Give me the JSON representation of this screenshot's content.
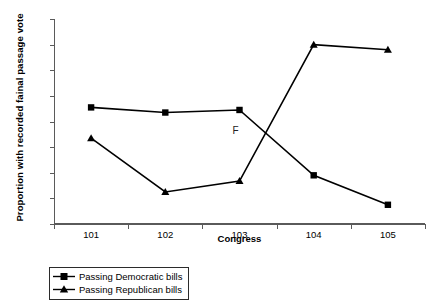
{
  "chart_data": {
    "type": "line",
    "title": "",
    "xlabel": "Congress",
    "ylabel": "Proportion with recorded fainal passage vote",
    "categories": [
      "101",
      "102",
      "103",
      "104",
      "105"
    ],
    "x": [
      101,
      102,
      103,
      104,
      105
    ],
    "ylim": [
      0,
      0.16
    ],
    "ytick_labels": [
      "0",
      "0.02",
      "0.04",
      "0.06",
      "0.08",
      "0.1",
      "0.12",
      "0.14",
      "0.16"
    ],
    "ytick_values": [
      0,
      0.02,
      0.04,
      0.06,
      0.08,
      0.1,
      0.12,
      0.14,
      0.16
    ],
    "grid": false,
    "legend_position": "bottom-left",
    "series": [
      {
        "name": "Passing Democratic bills",
        "marker": "square",
        "color": "#000000",
        "values": [
          0.091,
          0.087,
          0.089,
          0.038,
          0.015
        ]
      },
      {
        "name": "Passing Republican bills",
        "marker": "triangle",
        "color": "#000000",
        "values": [
          0.067,
          0.025,
          0.0335,
          0.14,
          0.136
        ]
      }
    ],
    "annotations": [
      {
        "text": "F",
        "x": 103,
        "y": 0.0715
      }
    ]
  },
  "axis": {
    "y_title": "Proportion with recorded fainal passage vote",
    "x_title": "Congress",
    "y_labels": [
      "0.16",
      "0.14",
      "0.12",
      "0.1",
      "0.08",
      "0.06",
      "0.04",
      "0.02",
      "0"
    ],
    "x_labels": [
      "101",
      "102",
      "103",
      "104",
      "105"
    ]
  },
  "legend": {
    "items": [
      {
        "label": "Passing Democratic bills",
        "marker": "square-marker"
      },
      {
        "label": "Passing Republican bills",
        "marker": "triangle-marker"
      }
    ]
  },
  "annotation": {
    "f_label": "F"
  }
}
